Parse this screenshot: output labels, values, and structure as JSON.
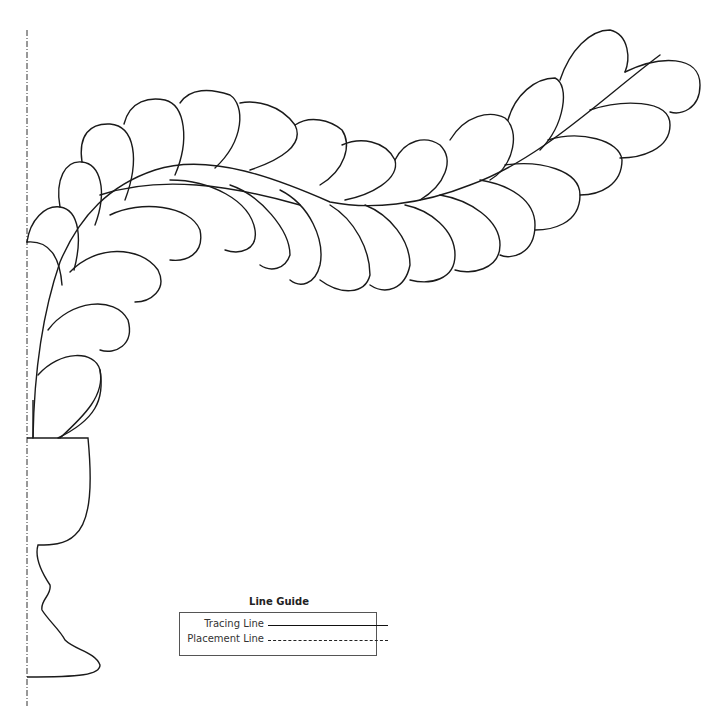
{
  "pattern": {
    "description": "Quilting feather plume growing from a goblet/vase",
    "stroke_color": "#1a1a1a",
    "placement_line_color": "#333333"
  },
  "line_guide": {
    "title": "Line Guide",
    "rows": [
      {
        "label": "Tracing Line",
        "style": "solid"
      },
      {
        "label": "Placement Line",
        "style": "dash-dot"
      }
    ]
  }
}
